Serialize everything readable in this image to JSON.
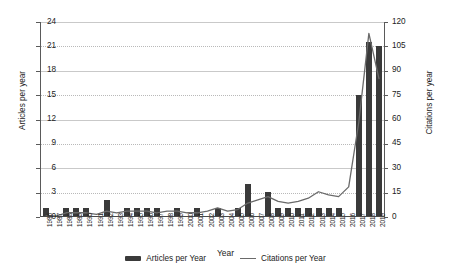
{
  "chart_data": {
    "type": "bar",
    "title": "",
    "xlabel": "Year",
    "ylabel": "Articles per year",
    "y2label": "Citations per year",
    "grid": true,
    "legend_position": "bottom",
    "ylim": [
      0,
      24
    ],
    "y2lim": [
      0,
      120
    ],
    "yticks": [
      0,
      3,
      6,
      9,
      12,
      15,
      18,
      21,
      24
    ],
    "y2ticks": [
      0,
      15,
      30,
      45,
      60,
      75,
      90,
      105,
      120
    ],
    "categories": [
      "1986",
      "1987",
      "1988",
      "1989",
      "1990",
      "1991",
      "1992",
      "1993",
      "1994",
      "1995",
      "1996",
      "1997",
      "1998",
      "1999",
      "2000",
      "2001",
      "2002",
      "2003",
      "2004",
      "2005",
      "2006",
      "2007",
      "2008",
      "2009",
      "2010",
      "2011",
      "2012",
      "2013",
      "2014",
      "2015",
      "2016",
      "2017",
      "2018",
      "2019"
    ],
    "series": [
      {
        "name": "Articles per Year",
        "type": "bar",
        "axis": "left",
        "color": "#3a3a3a",
        "values": [
          1,
          0,
          1,
          1,
          1,
          0,
          2,
          0,
          1,
          1,
          1,
          1,
          0,
          1,
          0,
          1,
          0,
          1,
          0,
          1,
          4,
          0,
          3,
          1,
          1,
          1,
          1,
          1,
          1,
          1,
          0,
          15,
          21.5,
          21
        ]
      },
      {
        "name": "Citations per Year",
        "type": "line",
        "axis": "right",
        "color": "#6a6a6a",
        "values": [
          0,
          0,
          2,
          2,
          2,
          1,
          3,
          2,
          3,
          3,
          3,
          2,
          3,
          3,
          2,
          2,
          3,
          5,
          3,
          4,
          8,
          10,
          12,
          9,
          8,
          9,
          11,
          15,
          13,
          12,
          18,
          58,
          113,
          85
        ]
      }
    ]
  },
  "legend": {
    "items": [
      {
        "label": "Articles per Year",
        "marker": "bar-swatch"
      },
      {
        "label": "Citations per Year",
        "marker": "line-swatch"
      }
    ]
  }
}
